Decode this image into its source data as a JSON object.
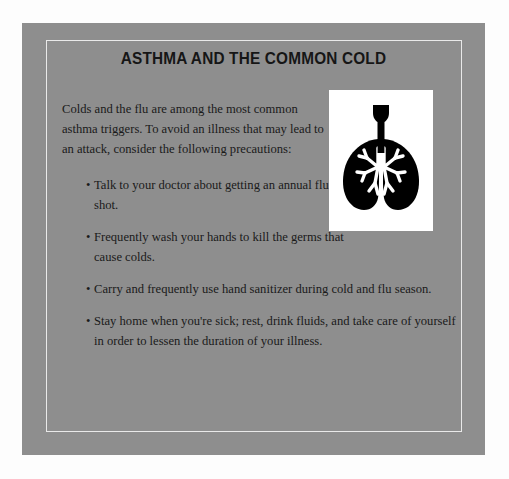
{
  "page": {
    "background_color": "#fdfdfd"
  },
  "card": {
    "background_color": "#8e8e8e",
    "inner_border_color": "#e9e9e9"
  },
  "header": {
    "title": "ASTHMA AND THE COMMON COLD"
  },
  "body": {
    "intro": "Colds and the flu are among the most common asthma triggers. To avoid an illness that may lead to an attack, consider the following precautions:",
    "bullet_glyph": "•",
    "precautions": [
      {
        "text": "Talk to your doctor about getting an annual flu shot.",
        "width": "narrow"
      },
      {
        "text": "Frequently wash your hands to kill the germs that cause colds.",
        "width": "narrow"
      },
      {
        "text": "Carry and frequently use hand sanitizer during cold and flu season.",
        "width": "wide"
      },
      {
        "text": "Stay home when you're sick; rest, drink fluids, and take care of yourself in order to lessen the duration of your illness.",
        "width": "wide"
      }
    ]
  },
  "figure": {
    "icon": "lungs-icon",
    "panel_background": "#ffffff",
    "silhouette_color": "#000000",
    "bronchi_color": "#ffffff"
  }
}
